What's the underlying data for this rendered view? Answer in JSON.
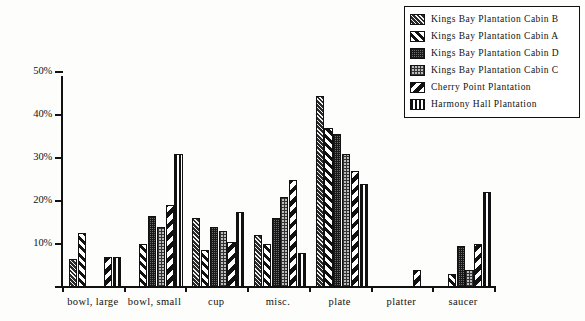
{
  "chart_data": {
    "type": "bar",
    "title": "",
    "xlabel": "",
    "ylabel": "",
    "ylim": [
      0,
      50
    ],
    "ytick_labels": [
      "0%",
      "10%",
      "20%",
      "30%",
      "40%",
      "50%"
    ],
    "ytick_values": [
      0,
      10,
      20,
      30,
      40,
      50
    ],
    "grid": false,
    "legend_position": "top-right",
    "value_unit": "%",
    "categories": [
      "bowl, large",
      "bowl, small",
      "cup",
      "misc.",
      "plate",
      "platter",
      "saucer"
    ],
    "series": [
      {
        "name": "Kings Bay Plantation Cabin B",
        "pattern": "dense-dark-back-diagonal",
        "values": [
          6.5,
          0,
          16,
          12,
          44.5,
          0,
          0
        ]
      },
      {
        "name": "Kings Bay Plantation Cabin A",
        "pattern": "wide-white-forward-diagonal",
        "values": [
          12.5,
          10,
          8.5,
          10,
          37,
          0,
          3
        ]
      },
      {
        "name": "Kings Bay Plantation Cabin D",
        "pattern": "medium-grey-stipple",
        "values": [
          0,
          16.5,
          14,
          16,
          35.5,
          0,
          9.5
        ]
      },
      {
        "name": "Kings Bay Plantation Cabin C",
        "pattern": "light-grey-stipple",
        "values": [
          0,
          14,
          13,
          21,
          31,
          0,
          4
        ]
      },
      {
        "name": "Cherry Point Plantation",
        "pattern": "bold-white-back-diagonal",
        "values": [
          7,
          19,
          10.5,
          25,
          27,
          4,
          10
        ]
      },
      {
        "name": "Harmony Hall Plantation",
        "pattern": "vertical-bands",
        "values": [
          7,
          31,
          17.5,
          8,
          24,
          0,
          22
        ]
      }
    ]
  },
  "legend": {
    "items": [
      {
        "label": "Kings Bay Plantation Cabin B"
      },
      {
        "label": "Kings Bay Plantation Cabin A"
      },
      {
        "label": "Kings Bay Plantation Cabin D"
      },
      {
        "label": "Kings Bay Plantation Cabin C"
      },
      {
        "label": "Cherry Point Plantation"
      },
      {
        "label": "Harmony Hall Plantation"
      }
    ]
  }
}
